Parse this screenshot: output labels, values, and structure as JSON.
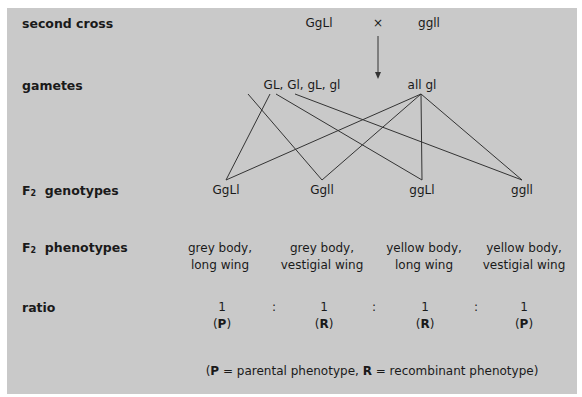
{
  "rows": {
    "second_cross": "second cross",
    "gametes": "gametes",
    "f2_genotypes": {
      "prefix": "F",
      "sub": "2",
      "rest": "genotypes"
    },
    "f2_phenotypes": {
      "prefix": "F",
      "sub": "2",
      "rest": "phenotypes"
    },
    "ratio": "ratio"
  },
  "cross": {
    "parent1": "GgLl",
    "times": "×",
    "parent2": "ggll"
  },
  "gametes": {
    "parent1": "GL, Gl, gL, gl",
    "parent2": "all gl"
  },
  "genotypes": [
    "GgLl",
    "Ggll",
    "ggLl",
    "ggll"
  ],
  "phenotypes": [
    {
      "line1": "grey body,",
      "line2": "long wing"
    },
    {
      "line1": "grey body,",
      "line2": "vestigial wing"
    },
    {
      "line1": "yellow body,",
      "line2": "long wing"
    },
    {
      "line1": "yellow body,",
      "line2": "vestigial wing"
    }
  ],
  "ratio": {
    "values": [
      "1",
      "1",
      "1",
      "1"
    ],
    "separator": ":",
    "types": [
      "P",
      "R",
      "R",
      "P"
    ]
  },
  "legend": {
    "open": "(",
    "p": "P",
    "p_text": " = parental phenotype, ",
    "r": "R",
    "r_text": " = recombinant phenotype)"
  },
  "colors": {
    "background": "#c9c9c9",
    "text": "#1a1a1a",
    "lines": "#333333"
  }
}
